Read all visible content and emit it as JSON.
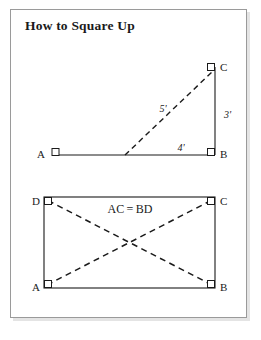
{
  "page": {
    "title": "How to Square Up",
    "background_color": "#ffffff",
    "frame_color": "#9a9a9a",
    "ink_color": "#1a1a1a"
  },
  "figures": [
    {
      "id": "triangle-3-4-5",
      "name": "right-triangle-diagram",
      "description": "3-4-5 right triangle method",
      "vertices": [
        {
          "key": "A",
          "label": "A",
          "x": 52,
          "y": 155,
          "marker": "right-angle-square",
          "label_side": "left"
        },
        {
          "key": "B",
          "label": "B",
          "x": 215,
          "y": 155,
          "marker": "right-angle-square",
          "label_side": "right"
        },
        {
          "key": "C",
          "label": "C",
          "x": 215,
          "y": 67,
          "marker": "right-angle-square",
          "label_side": "right"
        }
      ],
      "solid_edges": [
        {
          "from": "A",
          "to": "B"
        },
        {
          "from": "B",
          "to": "C"
        }
      ],
      "dashed_edges": [
        {
          "from_x": 125,
          "from_y": 155,
          "to_x": 212,
          "to_y": 72
        }
      ],
      "dimensions": [
        {
          "key": "hypotenuse",
          "text": "5'",
          "x": 163,
          "y": 112
        },
        {
          "key": "vertical",
          "text": "3'",
          "x": 224,
          "y": 115
        },
        {
          "key": "horizontal",
          "text": "4'",
          "x": 181,
          "y": 150
        }
      ]
    },
    {
      "id": "rectangle-diagonals",
      "name": "rectangle-diagonal-diagram",
      "description": "Rectangle with equal diagonals",
      "vertices": [
        {
          "key": "D",
          "label": "D",
          "x": 44,
          "y": 197,
          "marker": "right-angle-square",
          "label_side": "left"
        },
        {
          "key": "C",
          "label": "C",
          "x": 215,
          "y": 197,
          "marker": "right-angle-square",
          "label_side": "right"
        },
        {
          "key": "A",
          "label": "A",
          "x": 44,
          "y": 288,
          "marker": "right-angle-square",
          "label_side": "left"
        },
        {
          "key": "B",
          "label": "B",
          "x": 215,
          "y": 288,
          "marker": "right-angle-square",
          "label_side": "right"
        }
      ],
      "dashed_edges": [
        {
          "from": "A",
          "to": "C"
        },
        {
          "from": "B",
          "to": "D"
        }
      ],
      "annotations": [
        {
          "key": "equality",
          "text": "AC = BD",
          "x": 130,
          "y": 212
        }
      ]
    }
  ]
}
